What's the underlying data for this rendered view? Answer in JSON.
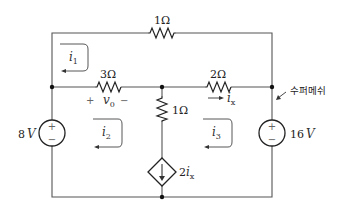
{
  "diagram": {
    "type": "circuit",
    "components": {
      "r_top": {
        "label": "1Ω",
        "value_ohm": 1
      },
      "r_left": {
        "label": "3Ω",
        "value_ohm": 3
      },
      "r_right": {
        "label": "2Ω",
        "value_ohm": 2
      },
      "r_mid": {
        "label": "1Ω",
        "value_ohm": 1
      },
      "v_left": {
        "label": "8V",
        "value_v": 8,
        "value_num": "8",
        "unit": "V"
      },
      "v_right": {
        "label": "16V",
        "value_v": 16,
        "value_num": "16",
        "unit": "V"
      },
      "dep_source": {
        "label": "2ix",
        "coef": "2",
        "var": "i",
        "var_sub": "x"
      }
    },
    "voltage_label": {
      "var": "v",
      "sub": "0",
      "plus": "+",
      "minus": "−"
    },
    "current_label": {
      "var": "i",
      "sub": "x"
    },
    "mesh_currents": [
      {
        "var": "i",
        "sub": "1"
      },
      {
        "var": "i",
        "sub": "2"
      },
      {
        "var": "i",
        "sub": "3"
      }
    ],
    "annotation": "수퍼메쉬",
    "source_signs": {
      "plus": "+",
      "minus": "−"
    }
  }
}
